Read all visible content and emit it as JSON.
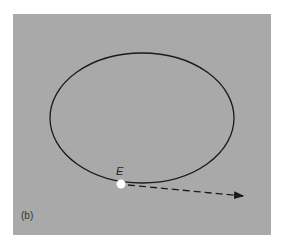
{
  "figure": {
    "panel_label": "(b)",
    "point_label": "E",
    "background_color": "#a9a9a9",
    "orbit": {
      "shape": "ellipse",
      "cx": 142,
      "cy": 118,
      "rx": 92,
      "ry": 65,
      "stroke": "#1a1a1a"
    },
    "point": {
      "name": "E",
      "x": 121,
      "y": 184,
      "fill": "#ffffff"
    },
    "tangent_arrow": {
      "style": "dashed",
      "from": [
        128,
        185
      ],
      "to": [
        244,
        196
      ],
      "stroke": "#1a1a1a"
    }
  }
}
